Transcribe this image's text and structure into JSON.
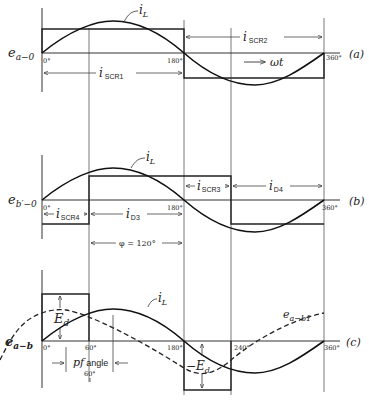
{
  "figure": {
    "panels": [
      {
        "id": "a",
        "tag": "(a)",
        "ylabel": "e",
        "ylabel_sub": "a−0",
        "axis_ticks": {
          "start": "0°",
          "mid": "180°",
          "end": "360°"
        },
        "current_label": "i",
        "current_sub": "L",
        "labels": {
          "scr1": "i",
          "scr1_sub": "SCR1",
          "scr2": "i",
          "scr2_sub": "SCR2",
          "direction": "ωt"
        }
      },
      {
        "id": "b",
        "tag": "(b)",
        "ylabel": "e",
        "ylabel_sub": "b′−0",
        "axis_ticks": {
          "start": "0°",
          "mid": "180°",
          "end": "360°"
        },
        "current_label": "i",
        "current_sub": "L",
        "labels": {
          "scr4": "i",
          "scr4_sub": "SCR4",
          "d3": "i",
          "d3_sub": "D3",
          "scr3": "i",
          "scr3_sub": "SCR3",
          "d4": "i",
          "d4_sub": "D4",
          "phi": "φ = 120°"
        }
      },
      {
        "id": "c",
        "tag": "(c)",
        "ylabel": "e",
        "ylabel_sub": "a−b",
        "axis_ticks": {
          "start": "0°",
          "t60": "60°",
          "mid": "180°",
          "t240": "240°",
          "end": "360°"
        },
        "current_label": "i",
        "current_sub": "L",
        "labels": {
          "ed": "E",
          "ed_sub": "d",
          "neg_ed": "−E",
          "neg_ed_sub": "d",
          "eab1": "e",
          "eab1_sub": "a−b1",
          "pf": "pf",
          "pf_angle": "angle",
          "pf_value": "60°"
        }
      }
    ]
  }
}
